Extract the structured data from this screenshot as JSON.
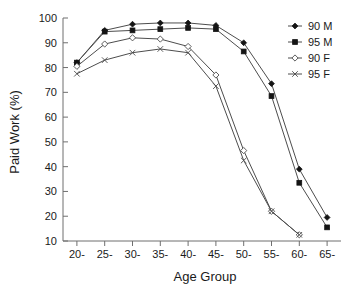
{
  "chart_data": {
    "type": "line",
    "title": "",
    "xlabel": "Age Group",
    "ylabel": "Paid Work (%)",
    "categories": [
      "20-",
      "25-",
      "30-",
      "35-",
      "40-",
      "45-",
      "50-",
      "55-",
      "60-",
      "65-"
    ],
    "ylim": [
      10,
      100
    ],
    "yticks": [
      10,
      20,
      30,
      40,
      50,
      60,
      70,
      80,
      90,
      100
    ],
    "ytick_labels": [
      "10",
      "20",
      "30",
      "40",
      "50",
      "60",
      "70",
      "80",
      "90",
      "100"
    ],
    "grid": false,
    "legend_position": "top-right",
    "series": [
      {
        "name": "90 M",
        "marker": "filled-diamond",
        "color": "#141414",
        "values": [
          82,
          95,
          97.5,
          98,
          98,
          97,
          90,
          73.5,
          39,
          19.5
        ]
      },
      {
        "name": "95 M",
        "marker": "filled-square",
        "color": "#141414",
        "values": [
          82,
          94.5,
          95,
          95.5,
          96,
          95.5,
          86.5,
          68.5,
          33.5,
          15.5
        ]
      },
      {
        "name": "90 F",
        "marker": "open-diamond",
        "color": "#4d4d4d",
        "values": [
          80.5,
          89.5,
          92,
          91.5,
          88.5,
          77,
          46.5,
          22,
          12.5,
          null
        ]
      },
      {
        "name": "95 F",
        "marker": "cross",
        "color": "#4d4d4d",
        "values": [
          77.5,
          83,
          86,
          87.5,
          86,
          72.5,
          42.5,
          22,
          12.5,
          null
        ]
      }
    ]
  },
  "legend": {
    "items": [
      {
        "label": "90 M"
      },
      {
        "label": "95 M"
      },
      {
        "label": "90 F"
      },
      {
        "label": "95 F"
      }
    ]
  }
}
